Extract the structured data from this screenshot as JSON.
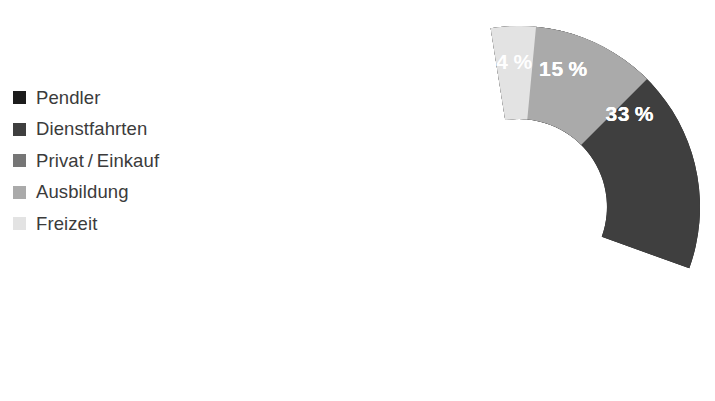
{
  "legend": {
    "items": [
      {
        "label": "Pendler",
        "color": "#1c1c1c",
        "swatch_name": "legend-swatch-pendler"
      },
      {
        "label": "Dienstfahrten",
        "color": "#3f3f3f",
        "swatch_name": "legend-swatch-dienstfahrten"
      },
      {
        "label": "Privat / Einkauf",
        "color": "#767676",
        "swatch_name": "legend-swatch-privat-einkauf"
      },
      {
        "label": "Ausbildung",
        "color": "#aaaaaa",
        "swatch_name": "legend-swatch-ausbildung"
      },
      {
        "label": "Freizeit",
        "color": "#e3e3e3",
        "swatch_name": "legend-swatch-freizeit"
      }
    ]
  },
  "chart_data": {
    "type": "pie",
    "variant": "donut",
    "title": "",
    "subtitle": "",
    "xlabel": "",
    "ylabel": "",
    "grid": false,
    "legend_position": "left",
    "units": "%",
    "total": 100,
    "inner_radius_ratio": 0.486,
    "start_angle_deg": -9,
    "categories": [
      "Pendler",
      "Dienstfahrten",
      "Privat / Einkauf",
      "Ausbildung",
      "Freizeit"
    ],
    "values": [
      33,
      33,
      15,
      15,
      4
    ],
    "slice_labels": [
      "33 %",
      "33 %",
      "15 %",
      "15 %",
      "4 %"
    ],
    "colors": [
      "#1c1c1c",
      "#3f3f3f",
      "#767676",
      "#aaaaaa",
      "#e3e3e3"
    ],
    "label_text_color": "#ffffff",
    "background_color": "#ffffff",
    "slices": [
      {
        "name": "Pendler",
        "value": 33,
        "label": "33 %",
        "color": "#1c1c1c"
      },
      {
        "name": "Dienstfahrten",
        "value": 33,
        "label": "33 %",
        "color": "#3f3f3f"
      },
      {
        "name": "Privat / Einkauf",
        "value": 15,
        "label": "15 %",
        "color": "#767676"
      },
      {
        "name": "Ausbildung",
        "value": 15,
        "label": "15 %",
        "color": "#aaaaaa"
      },
      {
        "name": "Freizeit",
        "value": 4,
        "label": "4 %",
        "color": "#e3e3e3"
      }
    ]
  }
}
